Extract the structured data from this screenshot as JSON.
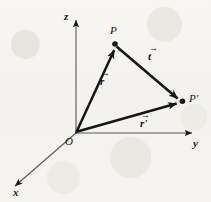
{
  "figure": {
    "background_color": "#f4f3f0",
    "ink_color": "#16161a",
    "axis_color": "#56565a"
  },
  "axes": [
    {
      "id": "z",
      "label": "z",
      "direction": "up",
      "from": [
        76,
        133
      ],
      "to": [
        76,
        18
      ],
      "arrowhead": true
    },
    {
      "id": "y",
      "label": "y",
      "direction": "right",
      "from": [
        76,
        133
      ],
      "to": [
        194,
        133
      ],
      "arrowhead": true
    },
    {
      "id": "x",
      "label": "x",
      "direction": "down-left",
      "from": [
        76,
        133
      ],
      "to": [
        13,
        188
      ],
      "arrowhead": true
    }
  ],
  "points": [
    {
      "id": "O",
      "label": "O",
      "coords": [
        76,
        133
      ],
      "dot": false
    },
    {
      "id": "P",
      "label": "P",
      "coords": [
        115,
        44
      ],
      "dot": true
    },
    {
      "id": "Pprime",
      "label": "P",
      "prime": "'",
      "coords": [
        182,
        101
      ],
      "dot": true
    }
  ],
  "vectors": [
    {
      "id": "r",
      "glyph": "r",
      "prime": "",
      "label_full": "r⃗",
      "from_point": "O",
      "to_point": "P",
      "from": [
        76,
        133
      ],
      "to": [
        115,
        47
      ],
      "label_pos": [
        103,
        76
      ]
    },
    {
      "id": "t",
      "glyph": "t",
      "prime": "",
      "label_full": "t⃗",
      "from_point": "P",
      "to_point": "Pprime",
      "from": [
        118,
        47
      ],
      "to": [
        179,
        99
      ],
      "label_pos": [
        150,
        50
      ]
    },
    {
      "id": "r-prime",
      "glyph": "r",
      "prime": "'",
      "label_full": "r⃗′",
      "from_point": "O",
      "to_point": "Pprime",
      "from": [
        79,
        131
      ],
      "to": [
        178,
        103
      ],
      "label_pos": [
        142,
        117
      ]
    }
  ],
  "axis_labels": {
    "z": {
      "text": "z",
      "pos": [
        66,
        16
      ]
    },
    "y": {
      "text": "y",
      "pos": [
        194,
        139
      ]
    },
    "x": {
      "text": "x",
      "pos": [
        14,
        190
      ]
    }
  },
  "point_labels": {
    "O": {
      "text": "O",
      "pos": [
        67,
        138
      ]
    },
    "P": {
      "text": "P",
      "pos": [
        111,
        27
      ]
    },
    "Pprime": {
      "text": "P",
      "prime": "'",
      "pos": [
        190,
        94
      ]
    }
  },
  "style": {
    "axis_stroke_width": 1.1,
    "vector_stroke_width": 2.6,
    "point_radius": 2.6
  }
}
